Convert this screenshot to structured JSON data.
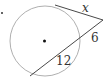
{
  "diagram": {
    "type": "circle-tangent-secant",
    "labels": {
      "tangent": "x",
      "secant_external": "6",
      "secant_internal": "12"
    },
    "colors": {
      "circle": "#9a9a9a",
      "lines": "#333333",
      "text": "#333333"
    }
  }
}
